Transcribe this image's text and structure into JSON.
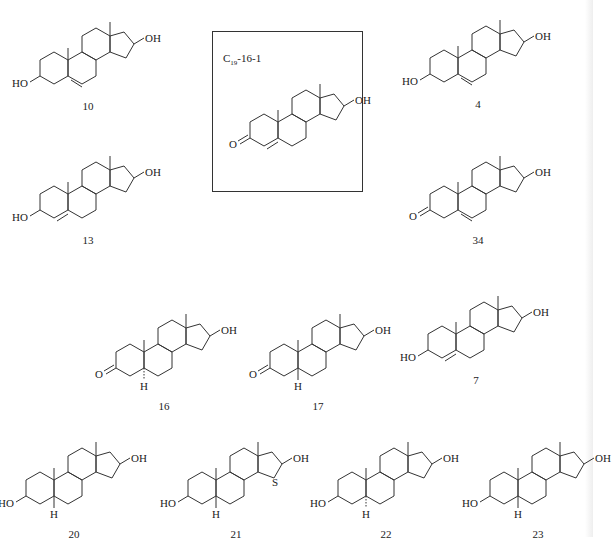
{
  "figure": {
    "type": "chemical-structures",
    "highlight_box": {
      "title_main": "C",
      "title_sub": "19",
      "title_rest": "-16-1"
    },
    "caption_text": "",
    "annotation_s": "S"
  },
  "compounds": [
    {
      "id": "10",
      "label": "10",
      "x": 2,
      "y": 8,
      "a_ring": "3-OH",
      "double_bond": "5",
      "h5": "none"
    },
    {
      "id": "c19-16-1",
      "label": "",
      "x": 212,
      "y": 70,
      "a_ring": "3-oxo",
      "double_bond": "4",
      "h5": "none"
    },
    {
      "id": "4",
      "label": "4",
      "x": 392,
      "y": 6,
      "a_ring": "3-OH",
      "double_bond": "5",
      "h5": "none"
    },
    {
      "id": "13",
      "label": "13",
      "x": 2,
      "y": 142,
      "a_ring": "3-OH",
      "double_bond": "4",
      "h5": "none"
    },
    {
      "id": "34",
      "label": "34",
      "x": 392,
      "y": 142,
      "a_ring": "3-oxo",
      "double_bond": "5",
      "h5": "none"
    },
    {
      "id": "16",
      "label": "16",
      "x": 78,
      "y": 300,
      "a_ring": "3-oxo",
      "double_bond": "none",
      "h5": "alpha"
    },
    {
      "id": "17",
      "label": "17",
      "x": 232,
      "y": 300,
      "a_ring": "3-oxo",
      "double_bond": "none",
      "h5": "beta"
    },
    {
      "id": "7",
      "label": "7",
      "x": 390,
      "y": 282,
      "a_ring": "3-OH",
      "double_bond": "4",
      "h5": "none"
    },
    {
      "id": "20",
      "label": "20",
      "x": -12,
      "y": 428,
      "a_ring": "3-OH",
      "double_bond": "none",
      "h5": "beta"
    },
    {
      "id": "21",
      "label": "21",
      "x": 150,
      "y": 428,
      "a_ring": "3-OH",
      "double_bond": "none",
      "h5": "beta"
    },
    {
      "id": "22",
      "label": "22",
      "x": 300,
      "y": 428,
      "a_ring": "3-OH",
      "double_bond": "none",
      "h5": "alpha-hash"
    },
    {
      "id": "23",
      "label": "23",
      "x": 452,
      "y": 428,
      "a_ring": "3-OH",
      "double_bond": "none",
      "h5": "beta"
    }
  ],
  "labels": {
    "oh": "OH",
    "ho": "HO",
    "o": "O",
    "h": "H"
  }
}
